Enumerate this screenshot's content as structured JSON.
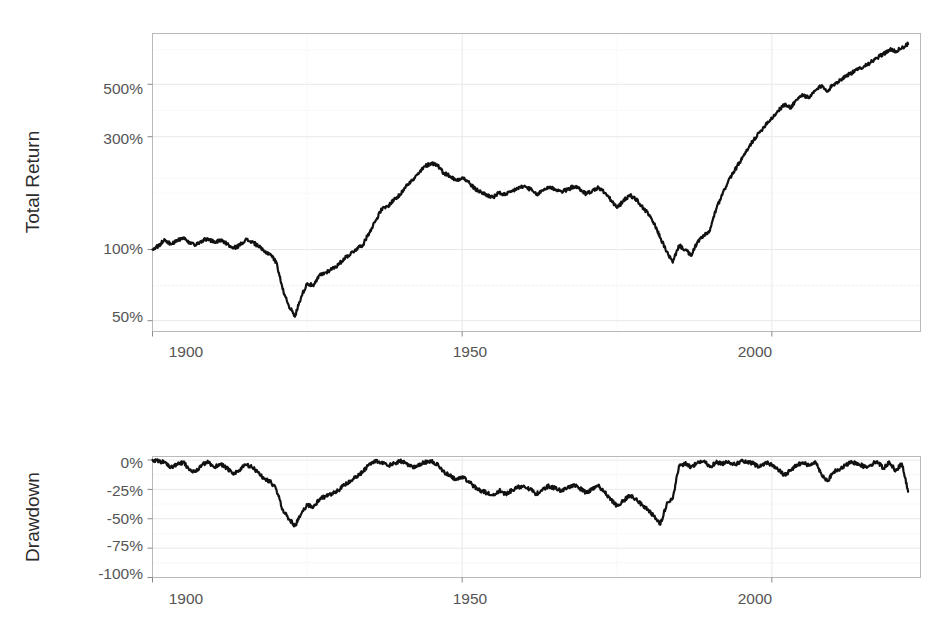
{
  "chart_data": [
    {
      "id": "total-return",
      "type": "line",
      "title": "",
      "xlabel": "",
      "ylabel": "Total Return",
      "yscale": "log",
      "ylim": [
        45,
        820
      ],
      "xlim": [
        1900,
        2024
      ],
      "grid": true,
      "legend": null,
      "ytick_values": [
        50,
        100,
        300,
        500
      ],
      "ytick_labels": [
        "50%",
        "100%",
        "300%",
        "500%"
      ],
      "xtick_values": [
        1900,
        1950,
        2000
      ],
      "xtick_labels": [
        "1900",
        "1950",
        "2000"
      ],
      "x": [
        1900,
        1901,
        1902,
        1903,
        1904,
        1905,
        1906,
        1907,
        1908,
        1909,
        1910,
        1911,
        1912,
        1913,
        1914,
        1915,
        1916,
        1917,
        1918,
        1919,
        1920,
        1921,
        1922,
        1923,
        1924,
        1925,
        1926,
        1927,
        1928,
        1929,
        1930,
        1931,
        1932,
        1933,
        1934,
        1935,
        1936,
        1937,
        1938,
        1939,
        1940,
        1941,
        1942,
        1943,
        1944,
        1945,
        1946,
        1947,
        1948,
        1949,
        1950,
        1951,
        1952,
        1953,
        1954,
        1955,
        1956,
        1957,
        1958,
        1959,
        1960,
        1961,
        1962,
        1963,
        1964,
        1965,
        1966,
        1967,
        1968,
        1969,
        1970,
        1971,
        1972,
        1973,
        1974,
        1975,
        1976,
        1977,
        1978,
        1979,
        1980,
        1981,
        1982,
        1983,
        1984,
        1985,
        1986,
        1987,
        1988,
        1989,
        1990,
        1991,
        1992,
        1993,
        1994,
        1995,
        1996,
        1997,
        1998,
        1999,
        2000,
        2001,
        2002,
        2003,
        2004,
        2005,
        2006,
        2007,
        2008,
        2009,
        2010,
        2011,
        2012,
        2013,
        2014,
        2015,
        2016,
        2017,
        2018,
        2019,
        2020,
        2021,
        2022
      ],
      "values": [
        100,
        104,
        110,
        105,
        109,
        112,
        106,
        104,
        109,
        111,
        107,
        110,
        106,
        101,
        104,
        110,
        108,
        104,
        98,
        96,
        88,
        68,
        58,
        52,
        63,
        72,
        70,
        78,
        80,
        83,
        86,
        92,
        96,
        101,
        105,
        118,
        132,
        148,
        152,
        163,
        170,
        188,
        196,
        210,
        225,
        232,
        228,
        211,
        205,
        196,
        202,
        193,
        181,
        175,
        170,
        166,
        174,
        170,
        176,
        182,
        185,
        180,
        170,
        178,
        184,
        180,
        176,
        179,
        185,
        180,
        172,
        177,
        183,
        174,
        162,
        150,
        160,
        170,
        164,
        152,
        142,
        128,
        112,
        98,
        88,
        104,
        100,
        94,
        108,
        114,
        120,
        148,
        170,
        196,
        216,
        238,
        262,
        290,
        312,
        338,
        360,
        385,
        410,
        398,
        430,
        452,
        436,
        470,
        492,
        470,
        500,
        520,
        545,
        560,
        580,
        600,
        620,
        645,
        672,
        700,
        690,
        712,
        740,
        762,
        740,
        752,
        700
      ],
      "series_note": "Indexed real total return, log scale"
    },
    {
      "id": "drawdown",
      "type": "line",
      "title": "",
      "xlabel": "",
      "ylabel": "Drawdown",
      "yscale": "linear",
      "ylim": [
        -100,
        3
      ],
      "xlim": [
        1900,
        2024
      ],
      "grid": true,
      "legend": null,
      "ytick_values": [
        0,
        -25,
        -50,
        -75,
        -100
      ],
      "ytick_labels": [
        "0%",
        "-25%",
        "-50%",
        "-75%",
        "-100%"
      ],
      "xtick_values": [
        1900,
        1950,
        2000
      ],
      "xtick_labels": [
        "1900",
        "1950",
        "2000"
      ],
      "x": [
        1900,
        1901,
        1902,
        1903,
        1904,
        1905,
        1906,
        1907,
        1908,
        1909,
        1910,
        1911,
        1912,
        1913,
        1914,
        1915,
        1916,
        1917,
        1918,
        1919,
        1920,
        1921,
        1922,
        1923,
        1924,
        1925,
        1926,
        1927,
        1928,
        1929,
        1930,
        1931,
        1932,
        1933,
        1934,
        1935,
        1936,
        1937,
        1938,
        1939,
        1940,
        1941,
        1942,
        1943,
        1944,
        1945,
        1946,
        1947,
        1948,
        1949,
        1950,
        1951,
        1952,
        1953,
        1954,
        1955,
        1956,
        1957,
        1958,
        1959,
        1960,
        1961,
        1962,
        1963,
        1964,
        1965,
        1966,
        1967,
        1968,
        1969,
        1970,
        1971,
        1972,
        1973,
        1974,
        1975,
        1976,
        1977,
        1978,
        1979,
        1980,
        1981,
        1982,
        1983,
        1984,
        1985,
        1986,
        1987,
        1988,
        1989,
        1990,
        1991,
        1992,
        1993,
        1994,
        1995,
        1996,
        1997,
        1998,
        1999,
        2000,
        2001,
        2002,
        2003,
        2004,
        2005,
        2006,
        2007,
        2008,
        2009,
        2010,
        2011,
        2012,
        2013,
        2014,
        2015,
        2016,
        2017,
        2018,
        2019,
        2020,
        2021,
        2022
      ],
      "values": [
        0,
        -1,
        -2,
        -6,
        -4,
        -2,
        -8,
        -10,
        -4,
        -2,
        -6,
        -3,
        -7,
        -12,
        -9,
        -4,
        -6,
        -10,
        -16,
        -18,
        -25,
        -42,
        -50,
        -56,
        -46,
        -38,
        -40,
        -33,
        -31,
        -29,
        -26,
        -21,
        -18,
        -14,
        -10,
        -3,
        -1,
        -2,
        -5,
        -3,
        -1,
        -3,
        -6,
        -4,
        -2,
        -1,
        -4,
        -10,
        -13,
        -17,
        -14,
        -18,
        -23,
        -26,
        -28,
        -30,
        -26,
        -29,
        -26,
        -23,
        -22,
        -25,
        -29,
        -25,
        -22,
        -24,
        -26,
        -24,
        -21,
        -24,
        -28,
        -25,
        -22,
        -27,
        -34,
        -39,
        -35,
        -30,
        -33,
        -38,
        -42,
        -48,
        -55,
        -38,
        -33,
        -5,
        -3,
        -6,
        -2,
        -1,
        -6,
        -2,
        -3,
        -1,
        -4,
        -1,
        -2,
        -3,
        -6,
        -2,
        -4,
        -8,
        -13,
        -9,
        -4,
        -2,
        -5,
        -1,
        -12,
        -18,
        -10,
        -8,
        -4,
        -2,
        -3,
        -6,
        -4,
        -1,
        -7,
        -2,
        -9,
        -3,
        -27
      ],
      "series_note": "Peak-to-trough drawdown from running maximum"
    }
  ],
  "panels": {
    "top": {
      "axis_title": "Total Return",
      "y_labels": [
        "500%",
        "300%",
        "100%",
        "50%"
      ],
      "x_labels": [
        "1900",
        "1950",
        "2000"
      ]
    },
    "bottom": {
      "axis_title": "Drawdown",
      "y_labels": [
        "0%",
        "-25%",
        "-50%",
        "-75%",
        "-100%"
      ],
      "x_labels": [
        "1900",
        "1950",
        "2000"
      ]
    }
  },
  "colors": {
    "background": "#ffffff",
    "line": "#111111",
    "grid_major": "#e8e8e8",
    "grid_minor": "#f2f2f2",
    "panel_border": "#b9b9b9",
    "tick_label": "#555555",
    "axis_title": "#2b2b2b"
  }
}
